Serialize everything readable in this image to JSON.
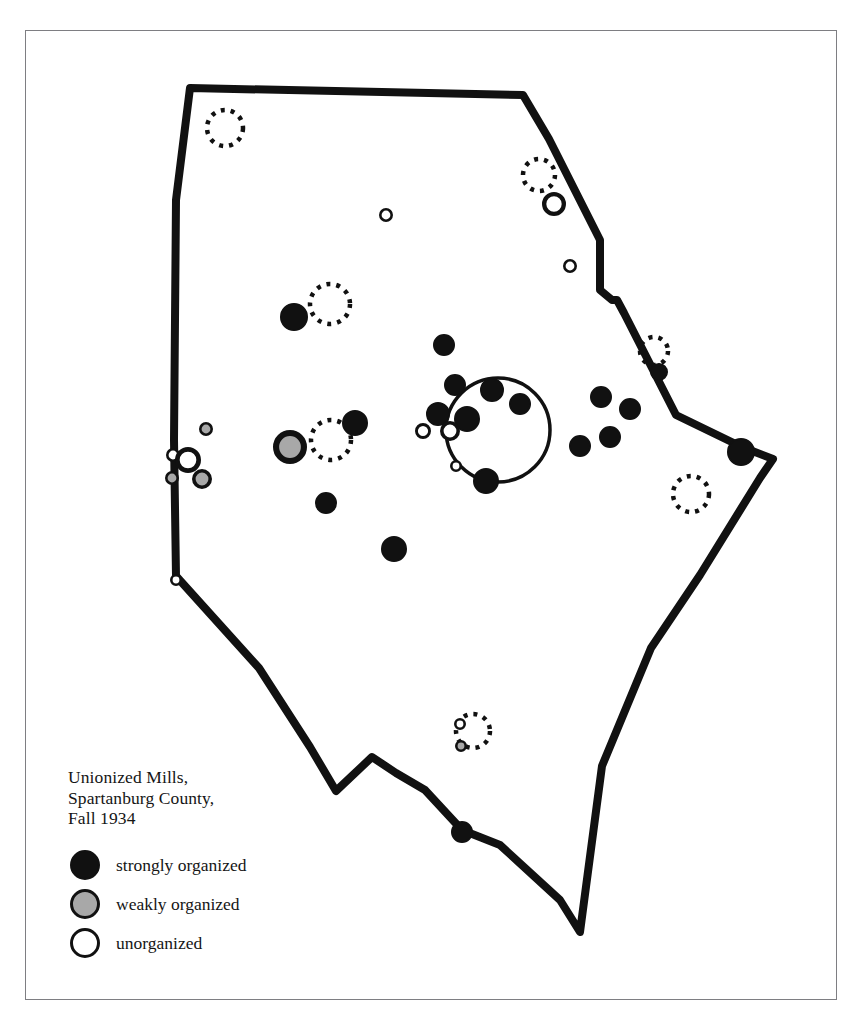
{
  "figure": {
    "background_color": "#ffffff",
    "frame_color": "#7e7e82"
  },
  "legend": {
    "title_lines": [
      "Unionized Mills,",
      "Spartanburg County,",
      "Fall 1934"
    ],
    "title_text": "Unionized Mills,\nSpartanburg County,\nFall 1934",
    "items": [
      {
        "key": "strongly",
        "label": "strongly organized",
        "fill": "#111111",
        "stroke": "#111111"
      },
      {
        "key": "weakly",
        "label": "weakly organized",
        "fill": "#a8a8a8",
        "stroke": "#111111"
      },
      {
        "key": "unorganized",
        "label": "unorganized",
        "fill": "#ffffff",
        "stroke": "#111111"
      }
    ]
  },
  "chart_data": {
    "type": "map",
    "title": "Unionized Mills, Spartanburg County, Fall 1934",
    "subtitle": "",
    "region": "Spartanburg County, South Carolina",
    "period": "Fall 1934",
    "legend_position": "bottom-left",
    "grid": false,
    "categories": [
      "strongly organized",
      "weakly organized",
      "unorganized"
    ],
    "category_colors": {
      "strongly organized": "#111111",
      "weakly organized": "#a8a8a8",
      "unorganized": "#ffffff"
    },
    "counts": {
      "strongly organized": 24,
      "weakly organized": 5,
      "unorganized": 11
    },
    "county_outline": "190,88 523,95 549,139 600,240 600,290 612,300 617,300 624,313 676,415 742,447 773,459 760,478 700,575 651,648 602,766 580,932 560,900 500,845 462,830 425,790 396,773 372,757 336,791 310,747 259,668 176,576 174,440 176,200",
    "city_circle": {
      "cx": 498,
      "cy": 430,
      "r": 52,
      "label": "Spartanburg city"
    },
    "locality_rings": [
      {
        "cx": 225,
        "cy": 128,
        "r": 18
      },
      {
        "cx": 539,
        "cy": 175,
        "r": 16
      },
      {
        "cx": 330,
        "cy": 304,
        "r": 20
      },
      {
        "cx": 654,
        "cy": 351,
        "r": 14
      },
      {
        "cx": 331,
        "cy": 440,
        "r": 20
      },
      {
        "cx": 691,
        "cy": 494,
        "r": 18
      },
      {
        "cx": 473,
        "cy": 731,
        "r": 17
      }
    ],
    "mills": [
      {
        "x": 386,
        "y": 215,
        "r": 7,
        "status": "unorganized"
      },
      {
        "x": 554,
        "y": 204,
        "r": 12,
        "status": "unorganized"
      },
      {
        "x": 570,
        "y": 266,
        "r": 7,
        "status": "unorganized"
      },
      {
        "x": 294,
        "y": 317,
        "r": 14,
        "status": "strongly organized"
      },
      {
        "x": 444,
        "y": 345,
        "r": 11,
        "status": "strongly organized"
      },
      {
        "x": 659,
        "y": 372,
        "r": 9,
        "status": "strongly organized"
      },
      {
        "x": 492,
        "y": 390,
        "r": 12,
        "status": "strongly organized"
      },
      {
        "x": 520,
        "y": 404,
        "r": 11,
        "status": "strongly organized"
      },
      {
        "x": 601,
        "y": 397,
        "r": 11,
        "status": "strongly organized"
      },
      {
        "x": 355,
        "y": 423,
        "r": 13,
        "status": "strongly organized"
      },
      {
        "x": 438,
        "y": 414,
        "r": 12,
        "status": "strongly organized"
      },
      {
        "x": 467,
        "y": 419,
        "r": 13,
        "status": "strongly organized"
      },
      {
        "x": 630,
        "y": 409,
        "r": 11,
        "status": "strongly organized"
      },
      {
        "x": 455,
        "y": 385,
        "r": 11,
        "status": "strongly organized"
      },
      {
        "x": 423,
        "y": 431,
        "r": 8,
        "status": "unorganized"
      },
      {
        "x": 450,
        "y": 431,
        "r": 10,
        "status": "unorganized"
      },
      {
        "x": 206,
        "y": 429,
        "r": 7,
        "status": "weakly organized"
      },
      {
        "x": 290,
        "y": 447,
        "r": 17,
        "status": "weakly organized"
      },
      {
        "x": 580,
        "y": 446,
        "r": 11,
        "status": "strongly organized"
      },
      {
        "x": 610,
        "y": 437,
        "r": 11,
        "status": "strongly organized"
      },
      {
        "x": 741,
        "y": 452,
        "r": 14,
        "status": "strongly organized"
      },
      {
        "x": 456,
        "y": 466,
        "r": 6,
        "status": "unorganized"
      },
      {
        "x": 486,
        "y": 481,
        "r": 13,
        "status": "strongly organized"
      },
      {
        "x": 173,
        "y": 455,
        "r": 7,
        "status": "unorganized"
      },
      {
        "x": 188,
        "y": 460,
        "r": 13,
        "status": "unorganized"
      },
      {
        "x": 172,
        "y": 478,
        "r": 7,
        "status": "weakly organized"
      },
      {
        "x": 202,
        "y": 479,
        "r": 10,
        "status": "weakly organized"
      },
      {
        "x": 326,
        "y": 503,
        "r": 11,
        "status": "strongly organized"
      },
      {
        "x": 394,
        "y": 549,
        "r": 13,
        "status": "strongly organized"
      },
      {
        "x": 176,
        "y": 580,
        "r": 6,
        "status": "unorganized"
      },
      {
        "x": 460,
        "y": 724,
        "r": 6,
        "status": "unorganized"
      },
      {
        "x": 461,
        "y": 746,
        "r": 6,
        "status": "weakly organized"
      },
      {
        "x": 462,
        "y": 832,
        "r": 11,
        "status": "strongly organized"
      }
    ]
  }
}
